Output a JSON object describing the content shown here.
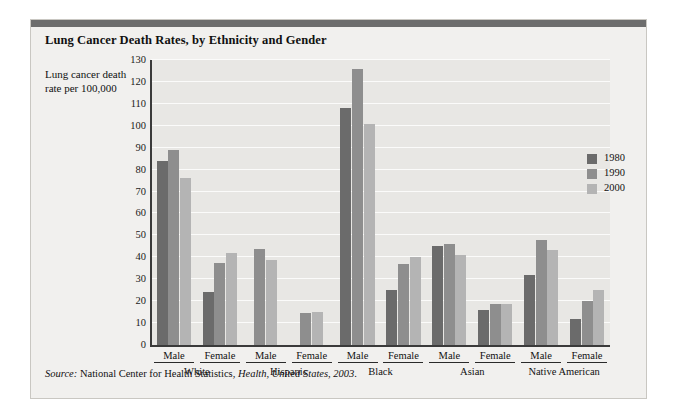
{
  "figure": {
    "title": "Lung Cancer Death Rates, by Ethnicity and Gender",
    "y_axis_label": "Lung cancer death rate per 100,000",
    "source_prefix": "Source:",
    "source_agency": " National Center for Health Statistics, ",
    "source_publication": "Health, United States, 2003",
    "source_suffix": "."
  },
  "colors": {
    "series_1980": "#6b6b6b",
    "series_1990": "#8e8e8e",
    "series_2000": "#b4b4b4",
    "plot_background": "#e8e7e4",
    "figure_background": "#f1f0ee",
    "gridline": "#fbfbfa",
    "axis": "#3a3a3a",
    "top_rule": "#6d6d6d"
  },
  "legend": {
    "position": "right-inside",
    "entries": [
      {
        "label": "1980",
        "color": "#6b6b6b"
      },
      {
        "label": "1990",
        "color": "#8e8e8e"
      },
      {
        "label": "2000",
        "color": "#b4b4b4"
      }
    ]
  },
  "chart_data": {
    "type": "bar",
    "title": "Lung Cancer Death Rates, by Ethnicity and Gender",
    "xlabel": "",
    "ylabel": "Lung cancer death rate per 100,000",
    "ylim": [
      0,
      130
    ],
    "ytick_step": 10,
    "yticks": [
      0,
      10,
      20,
      30,
      40,
      50,
      60,
      70,
      80,
      90,
      100,
      110,
      120,
      130
    ],
    "grid": true,
    "grid_axis": "y",
    "ethnicities": [
      "White",
      "Hispanic",
      "Black",
      "Asian",
      "Native American"
    ],
    "genders": [
      "Male",
      "Female"
    ],
    "categories": [
      "White Male",
      "White Female",
      "Hispanic Male",
      "Hispanic Female",
      "Black Male",
      "Black Female",
      "Asian Male",
      "Asian Female",
      "Native American Male",
      "Native American Female"
    ],
    "series": [
      {
        "name": "1980",
        "color": "#6b6b6b",
        "values": [
          84,
          24,
          null,
          null,
          108,
          25,
          45,
          16,
          32,
          12
        ]
      },
      {
        "name": "1990",
        "color": "#8e8e8e",
        "values": [
          89,
          37.5,
          44,
          14.5,
          126,
          37,
          46,
          18.5,
          48,
          20
        ]
      },
      {
        "name": "2000",
        "color": "#b4b4b4",
        "values": [
          76,
          42,
          39,
          15,
          101,
          40,
          41,
          18.5,
          43.5,
          25
        ]
      }
    ]
  }
}
